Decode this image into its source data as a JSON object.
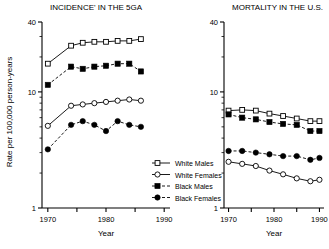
{
  "figure": {
    "ylabel": "Rate per 100,000 person-years",
    "legend": [
      {
        "label": "White Males",
        "marker": "open-square",
        "line": "solid"
      },
      {
        "label": "White Females",
        "marker": "open-circle",
        "line": "solid"
      },
      {
        "label": "Black Males",
        "marker": "filled-square",
        "line": "dashed"
      },
      {
        "label": "Black Females",
        "marker": "filled-circle",
        "line": "dashed"
      }
    ]
  },
  "chart_data": [
    {
      "type": "line",
      "title": "INCIDENCE' IN THE 5GA",
      "xlabel": "Year",
      "ylabel": "Rate per 100,000 person-years",
      "yscale": "log",
      "ylim": [
        1,
        40
      ],
      "yticks": [
        1,
        10,
        40
      ],
      "ytick_labels": [
        "1",
        "10",
        "40"
      ],
      "xlim": [
        1969,
        1991
      ],
      "xticks": [
        1970,
        1975,
        1980,
        1985,
        1990
      ],
      "xtick_labels": [
        "1970",
        "",
        "1980",
        "",
        "1990"
      ],
      "grid": false,
      "legend_position": "outside-lower-right",
      "series": [
        {
          "name": "White Males",
          "marker": "open-square",
          "x": [
            1970,
            1974,
            1976,
            1978,
            1980,
            1982,
            1984,
            1986
          ],
          "y": [
            17.5,
            25.0,
            26.5,
            27.0,
            27.0,
            27.5,
            27.5,
            28.5
          ]
        },
        {
          "name": "Black Males",
          "marker": "filled-square",
          "x": [
            1970,
            1974,
            1976,
            1978,
            1980,
            1982,
            1984,
            1986
          ],
          "y": [
            11.5,
            16.5,
            15.8,
            16.5,
            16.8,
            17.5,
            17.5,
            15.0
          ]
        },
        {
          "name": "White Females",
          "marker": "open-circle",
          "x": [
            1970,
            1974,
            1976,
            1978,
            1980,
            1982,
            1984,
            1986
          ],
          "y": [
            5.1,
            7.6,
            7.8,
            8.0,
            8.2,
            8.4,
            8.6,
            8.4
          ]
        },
        {
          "name": "Black Females",
          "marker": "filled-circle",
          "x": [
            1970,
            1974,
            1976,
            1978,
            1980,
            1982,
            1984,
            1986
          ],
          "y": [
            3.2,
            5.2,
            5.6,
            5.2,
            4.6,
            5.6,
            5.2,
            5.0
          ]
        }
      ]
    },
    {
      "type": "line",
      "title": "MORTALITY IN THE U.S.",
      "xlabel": "Year",
      "ylabel": "Rate per 100,000 person-years",
      "yscale": "log",
      "ylim": [
        1,
        40
      ],
      "yticks": [
        1,
        10,
        40
      ],
      "ytick_labels": [
        "1",
        "10",
        "40"
      ],
      "xlim": [
        1969,
        1991
      ],
      "xticks": [
        1970,
        1975,
        1980,
        1985,
        1990
      ],
      "xtick_labels": [
        "1970",
        "",
        "1980",
        "",
        "1990"
      ],
      "grid": false,
      "legend_position": "outside-lower-left",
      "series": [
        {
          "name": "White Males",
          "marker": "open-square",
          "x": [
            1970,
            1973,
            1976,
            1979,
            1982,
            1985,
            1988,
            1990
          ],
          "y": [
            6.9,
            7.0,
            6.9,
            6.5,
            6.2,
            5.9,
            5.6,
            5.6
          ]
        },
        {
          "name": "Black Males",
          "marker": "filled-square",
          "x": [
            1970,
            1973,
            1976,
            1979,
            1982,
            1985,
            1988,
            1990
          ],
          "y": [
            6.4,
            6.0,
            5.8,
            5.5,
            5.3,
            5.2,
            4.6,
            4.6
          ]
        },
        {
          "name": "Black Females",
          "marker": "filled-circle",
          "x": [
            1970,
            1973,
            1976,
            1979,
            1982,
            1985,
            1988,
            1990
          ],
          "y": [
            3.1,
            3.1,
            3.0,
            2.9,
            2.8,
            2.8,
            2.6,
            2.7
          ]
        },
        {
          "name": "White Females",
          "marker": "open-circle",
          "x": [
            1970,
            1973,
            1976,
            1979,
            1982,
            1985,
            1988,
            1990
          ],
          "y": [
            2.5,
            2.4,
            2.3,
            2.1,
            1.95,
            1.8,
            1.7,
            1.75
          ]
        }
      ]
    }
  ]
}
